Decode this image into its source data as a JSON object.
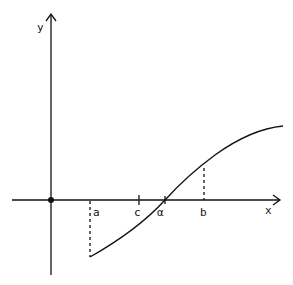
{
  "diagram": {
    "type": "function-graph",
    "axes": {
      "x_label": "x",
      "y_label": "y"
    },
    "points": {
      "a": "a",
      "c": "c",
      "alpha": "α",
      "b": "b"
    },
    "colors": {
      "stroke": "#111111",
      "background": "#ffffff"
    }
  }
}
